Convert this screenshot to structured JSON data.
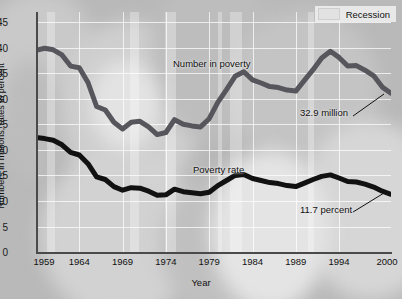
{
  "chart_data": {
    "type": "line",
    "title": "",
    "xlabel": "Year",
    "ylabel": "Numbers in millions, rates in percent",
    "xlim": [
      1959,
      2000
    ],
    "ylim": [
      0,
      47
    ],
    "grid": true,
    "legend_position": "top-right",
    "legend": [
      {
        "label": "Recession",
        "color": "#e2e2e2"
      }
    ],
    "ytick_labels": [
      "0",
      "5",
      "10",
      "15",
      "20",
      "25",
      "30",
      "35",
      "40",
      "45"
    ],
    "ytick_values": [
      0,
      5,
      10,
      15,
      20,
      25,
      30,
      35,
      40,
      45
    ],
    "xtick_labels": [
      "1959",
      "1964",
      "1969",
      "1974",
      "1979",
      "1984",
      "1989",
      "1994",
      "2000"
    ],
    "xtick_values": [
      1959,
      1964,
      1969,
      1974,
      1979,
      1984,
      1989,
      1994,
      2000
    ],
    "x": [
      1959,
      1960,
      1961,
      1962,
      1963,
      1964,
      1965,
      1966,
      1967,
      1968,
      1969,
      1970,
      1971,
      1972,
      1973,
      1974,
      1975,
      1976,
      1977,
      1978,
      1979,
      1980,
      1981,
      1982,
      1983,
      1984,
      1985,
      1986,
      1987,
      1988,
      1989,
      1990,
      1991,
      1992,
      1993,
      1994,
      1995,
      1996,
      1997,
      1998,
      1999,
      2000
    ],
    "series": [
      {
        "name": "Number in poverty",
        "units": "millions",
        "color": "#56565c",
        "values": [
          39.5,
          39.9,
          39.6,
          38.6,
          36.4,
          36.1,
          33.2,
          28.5,
          27.8,
          25.4,
          24.1,
          25.4,
          25.6,
          24.5,
          23.0,
          23.4,
          25.9,
          25.0,
          24.7,
          24.5,
          26.1,
          29.3,
          31.8,
          34.4,
          35.3,
          33.7,
          33.1,
          32.4,
          32.2,
          31.7,
          31.5,
          33.6,
          35.7,
          38.0,
          39.3,
          38.1,
          36.4,
          36.5,
          35.6,
          34.5,
          32.3,
          31.1
        ],
        "end_label": "32.9 million"
      },
      {
        "name": "Poverty rate",
        "units": "percent",
        "color": "#111111",
        "values": [
          22.4,
          22.2,
          21.9,
          21.0,
          19.5,
          19.0,
          17.3,
          14.7,
          14.2,
          12.8,
          12.1,
          12.6,
          12.5,
          11.9,
          11.1,
          11.2,
          12.3,
          11.8,
          11.6,
          11.4,
          11.7,
          13.0,
          14.0,
          15.0,
          15.2,
          14.4,
          14.0,
          13.6,
          13.4,
          13.0,
          12.8,
          13.5,
          14.2,
          14.8,
          15.1,
          14.5,
          13.8,
          13.7,
          13.3,
          12.7,
          11.9,
          11.3
        ],
        "end_label": "11.7 percent"
      }
    ],
    "recession_bands": [
      {
        "start": 1960.3,
        "end": 1961.2
      },
      {
        "start": 1969.9,
        "end": 1970.9
      },
      {
        "start": 1973.9,
        "end": 1975.2
      },
      {
        "start": 1980.1,
        "end": 1980.6
      },
      {
        "start": 1981.5,
        "end": 1982.9
      },
      {
        "start": 1990.5,
        "end": 1991.2
      }
    ],
    "annotations": [
      {
        "name": "number-in-poverty-label",
        "text": "Number in poverty",
        "x": 1979.2,
        "y": 38.6
      },
      {
        "name": "poverty-rate-label",
        "text": "Poverty rate",
        "x": 1977.6,
        "y": 18.6
      },
      {
        "name": "number-end-annotation",
        "text": "32.9 million",
        "x": 1992.0,
        "y": 25.2
      },
      {
        "name": "rate-end-annotation",
        "text": "11.7 percent",
        "x": 1991.6,
        "y": 6.2
      }
    ]
  }
}
